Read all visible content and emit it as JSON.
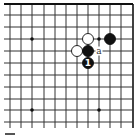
{
  "diagram": {
    "type": "go-board-fragment",
    "corner": "top-right",
    "colors": {
      "background": "#ffffff",
      "line": "#333333",
      "border": "#111111",
      "black_stone": "#111111",
      "white_stone": "#ffffff",
      "stone_outline": "#111111"
    },
    "grid": {
      "columns_x": [
        10,
        21,
        32,
        44,
        55,
        66,
        77,
        88,
        99,
        110,
        121,
        133
      ],
      "rows_y": [
        4,
        15,
        27,
        39,
        51,
        63,
        75,
        87,
        99,
        110,
        122
      ],
      "edge_top_y": 4,
      "edge_right_x": 133,
      "line_extent_left": 4,
      "line_extent_bottom": 128
    },
    "star_points": [
      {
        "x": 32,
        "y": 39
      },
      {
        "x": 99,
        "y": 39
      },
      {
        "x": 32,
        "y": 110
      },
      {
        "x": 99,
        "y": 110
      }
    ],
    "stones": [
      {
        "color": "white",
        "x": 88,
        "y": 39,
        "label": ""
      },
      {
        "color": "black",
        "x": 110,
        "y": 39,
        "label": ""
      },
      {
        "color": "white",
        "x": 77,
        "y": 51,
        "label": ""
      },
      {
        "color": "black",
        "x": 88,
        "y": 51,
        "label": ""
      },
      {
        "color": "black",
        "x": 88,
        "y": 63,
        "label": "1"
      }
    ],
    "markers": [
      {
        "x": 99,
        "y": 51,
        "label": "a"
      }
    ],
    "stone_radius": 5.5
  }
}
